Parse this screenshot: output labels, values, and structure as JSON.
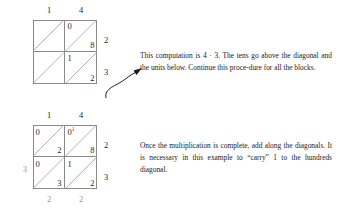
{
  "figure": {
    "type": "lattice-multiplication",
    "problem": "14 x 23",
    "top_grid": {
      "col_headers": [
        "1",
        "4"
      ],
      "right_labels": [
        "2",
        "3"
      ],
      "cells": [
        {
          "row": 0,
          "col": 0,
          "upper": "",
          "lower": ""
        },
        {
          "row": 0,
          "col": 1,
          "upper": "0",
          "lower": "8"
        },
        {
          "row": 1,
          "col": 0,
          "upper": "",
          "lower": ""
        },
        {
          "row": 1,
          "col": 1,
          "upper": "1",
          "lower": "2"
        }
      ]
    },
    "bottom_grid": {
      "col_headers": [
        "1",
        "4"
      ],
      "right_labels": [
        "2",
        "3"
      ],
      "left_label": "3",
      "bottom_labels": [
        "2",
        "2"
      ],
      "cells": [
        {
          "row": 0,
          "col": 0,
          "upper": "0",
          "lower": "2",
          "carry": ""
        },
        {
          "row": 0,
          "col": 1,
          "upper": "0",
          "lower": "8",
          "carry": "1"
        },
        {
          "row": 1,
          "col": 0,
          "upper": "0",
          "lower": "3",
          "carry": ""
        },
        {
          "row": 1,
          "col": 1,
          "upper": "1",
          "lower": "2",
          "carry": ""
        }
      ]
    }
  },
  "text": {
    "paragraph_one": "This computation is 4 · 3. The tens go above the diagonal and the units below. Continue this proce-dure for all the blocks.",
    "paragraph_two": "Once the multiplication is complete, add along the diagonals. It is necessary in this example to “carry” 1 to the hundreds diagonal."
  }
}
